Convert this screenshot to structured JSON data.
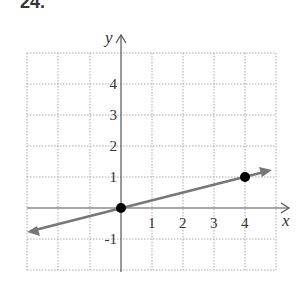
{
  "problem_number": "24.",
  "axes": {
    "x_label": "x",
    "y_label": "y"
  },
  "x_ticks": [
    "1",
    "2",
    "3",
    "4"
  ],
  "y_ticks": [
    "4",
    "3",
    "2",
    "1",
    "-1"
  ],
  "line": {
    "points": [
      {
        "x": 0,
        "y": 0
      },
      {
        "x": 4,
        "y": 1
      }
    ],
    "equation": "y = x/4"
  },
  "colors": {
    "grid": "#999999",
    "axis": "#555555",
    "line": "#777777",
    "point": "#000000"
  }
}
